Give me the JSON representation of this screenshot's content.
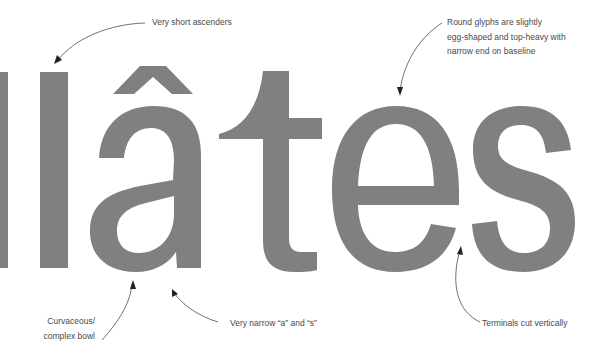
{
  "specimen": {
    "word": "llâtes",
    "glyph_color": "#808080",
    "background": "#ffffff"
  },
  "annotations": {
    "ascenders": {
      "lines": [
        "Very short ascenders"
      ]
    },
    "round_glyphs": {
      "lines": [
        "Round glyphs are slightly",
        "egg-shaped and top-heavy with",
        "narrow end on baseline"
      ]
    },
    "bowl": {
      "lines": [
        "Curvaceous/",
        "complex bowl"
      ]
    },
    "narrow": {
      "lines": [
        "Very narrow “a” and “s”"
      ]
    },
    "terminals": {
      "lines": [
        "Terminals cut vertically"
      ]
    }
  },
  "colors": {
    "annotation_text": "#4a4a4a",
    "arrow": "#333333"
  }
}
